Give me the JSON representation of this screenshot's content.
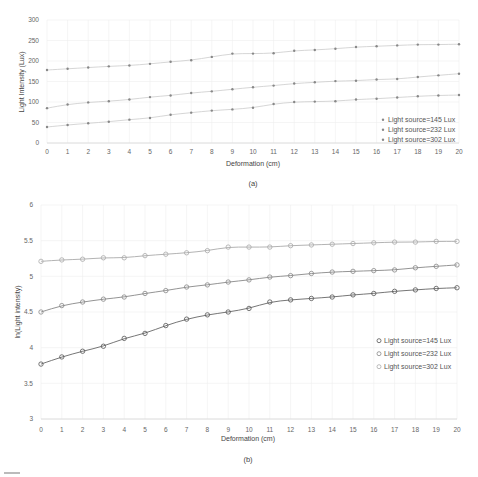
{
  "chart_data": [
    {
      "panel": "a",
      "type": "line",
      "caption": "(a)",
      "title": "",
      "xlabel": "Deformation (cm)",
      "ylabel": "Light Intensity (Lux)",
      "xlim": [
        0,
        20
      ],
      "ylim": [
        0,
        300
      ],
      "x": [
        0,
        1,
        2,
        3,
        4,
        5,
        6,
        7,
        8,
        9,
        10,
        11,
        12,
        13,
        14,
        15,
        16,
        17,
        18,
        19,
        20
      ],
      "x_ticks": [
        "0",
        "1",
        "2",
        "3",
        "4",
        "5",
        "6",
        "7",
        "8",
        "9",
        "10",
        "11",
        "12",
        "13",
        "14",
        "15",
        "16",
        "17",
        "18",
        "19",
        "20"
      ],
      "y_ticks": [
        "0",
        "50",
        "100",
        "150",
        "200",
        "250",
        "300"
      ],
      "grid": true,
      "legend_position": "lower right",
      "series": [
        {
          "name": "Light source=145 Lux",
          "marker": "asterisk",
          "values": [
            39,
            44,
            48,
            52,
            57,
            61,
            69,
            74,
            79,
            82,
            86,
            95,
            100,
            101,
            102,
            106,
            108,
            111,
            114,
            116,
            117
          ]
        },
        {
          "name": "Light source=232 Lux",
          "marker": "asterisk",
          "values": [
            85,
            94,
            99,
            102,
            106,
            112,
            116,
            122,
            126,
            131,
            136,
            140,
            145,
            148,
            151,
            152,
            155,
            156,
            161,
            165,
            169
          ]
        },
        {
          "name": "Light source=302 Lux",
          "marker": "asterisk",
          "values": [
            178,
            181,
            184,
            187,
            189,
            193,
            198,
            202,
            210,
            218,
            218,
            219,
            225,
            227,
            230,
            234,
            236,
            238,
            240,
            240,
            241
          ]
        }
      ]
    },
    {
      "panel": "b",
      "type": "line",
      "caption": "(b)",
      "title": "",
      "xlabel": "Deformation (cm)",
      "ylabel": "ln(Light intensity)",
      "xlim": [
        0,
        20
      ],
      "ylim": [
        3,
        6
      ],
      "x": [
        0,
        1,
        2,
        3,
        4,
        5,
        6,
        7,
        8,
        9,
        10,
        11,
        12,
        13,
        14,
        15,
        16,
        17,
        18,
        19,
        20
      ],
      "x_ticks": [
        "0",
        "1",
        "2",
        "3",
        "4",
        "5",
        "6",
        "7",
        "8",
        "9",
        "10",
        "11",
        "12",
        "13",
        "14",
        "15",
        "16",
        "17",
        "18",
        "19",
        "20"
      ],
      "y_ticks": [
        "3",
        "3.5",
        "4",
        "4.5",
        "5",
        "5.5",
        "6"
      ],
      "grid": true,
      "legend_position": "lower right",
      "series": [
        {
          "name": "Light source=145 Lux",
          "marker": "circle",
          "color": "#555555",
          "values": [
            3.77,
            3.87,
            3.95,
            4.02,
            4.13,
            4.2,
            4.31,
            4.4,
            4.46,
            4.5,
            4.55,
            4.64,
            4.67,
            4.69,
            4.71,
            4.74,
            4.76,
            4.79,
            4.81,
            4.83,
            4.84
          ]
        },
        {
          "name": "Light source=232 Lux",
          "marker": "circle",
          "color": "#888888",
          "values": [
            4.5,
            4.59,
            4.64,
            4.68,
            4.71,
            4.76,
            4.8,
            4.85,
            4.88,
            4.92,
            4.95,
            4.99,
            5.01,
            5.04,
            5.06,
            5.07,
            5.08,
            5.09,
            5.12,
            5.14,
            5.16
          ]
        },
        {
          "name": "Light source=302 Lux",
          "marker": "circle",
          "color": "#aaaaaa",
          "values": [
            5.21,
            5.23,
            5.24,
            5.26,
            5.26,
            5.29,
            5.31,
            5.33,
            5.36,
            5.41,
            5.41,
            5.41,
            5.43,
            5.44,
            5.45,
            5.46,
            5.47,
            5.48,
            5.48,
            5.49,
            5.49
          ]
        }
      ]
    }
  ],
  "labels": {
    "a_xlabel": "Deformation (cm)",
    "a_ylabel": "Light Intensity (Lux)",
    "a_caption": "(a)",
    "b_xlabel": "Deformation (cm)",
    "b_ylabel": "ln(Light intensity)",
    "b_caption": "(b)"
  }
}
